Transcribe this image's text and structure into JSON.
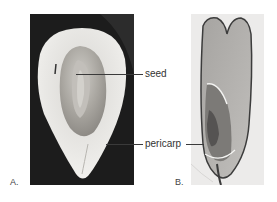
{
  "figure": {
    "panels": [
      {
        "id": "A",
        "letter": "A.",
        "description": "Longitudinal section photograph of fruit on dark background"
      },
      {
        "id": "B",
        "letter": "B.",
        "description": "Longitudinal section micrograph of grain on light background"
      }
    ],
    "labels": {
      "seed": "seed",
      "pericarp": "pericarp"
    },
    "colors": {
      "panel_a_background": "#1e1e1e",
      "panel_b_background": "#ecebea",
      "leader_line": "#3a3a3a",
      "label_text": "#333333"
    }
  }
}
